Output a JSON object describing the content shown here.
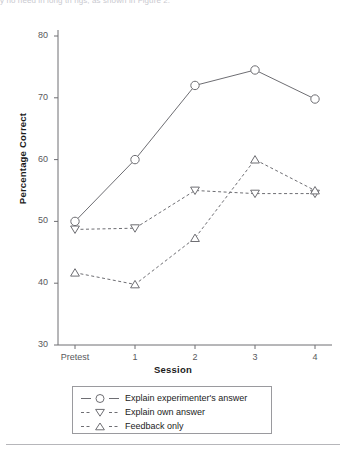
{
  "top_fragment": "y  no need in long th  ngs, as shown in Figure 2.",
  "chart_data": {
    "type": "line",
    "title": "",
    "xlabel": "Session",
    "ylabel": "Percentage Correct",
    "categories": [
      "Pretest",
      "1",
      "2",
      "3",
      "4"
    ],
    "ylim": [
      30,
      80
    ],
    "yticks": [
      30,
      40,
      50,
      60,
      70,
      80
    ],
    "grid": false,
    "legend_position": "below-plot",
    "series": [
      {
        "name": "Explain experimenter's answer",
        "marker": "open-circle",
        "linestyle": "solid",
        "color": "#6e6e73",
        "values": [
          50.0,
          60.0,
          72.0,
          74.5,
          69.8
        ]
      },
      {
        "name": "Explain own answer",
        "marker": "down-triangle",
        "linestyle": "dashed",
        "color": "#6e6e73",
        "values": [
          48.7,
          48.9,
          55.0,
          54.5,
          54.5
        ]
      },
      {
        "name": "Feedback only",
        "marker": "up-triangle",
        "linestyle": "dashed",
        "color": "#6e6e73",
        "values": [
          41.7,
          39.8,
          47.3,
          60.0,
          55.0
        ]
      }
    ]
  }
}
